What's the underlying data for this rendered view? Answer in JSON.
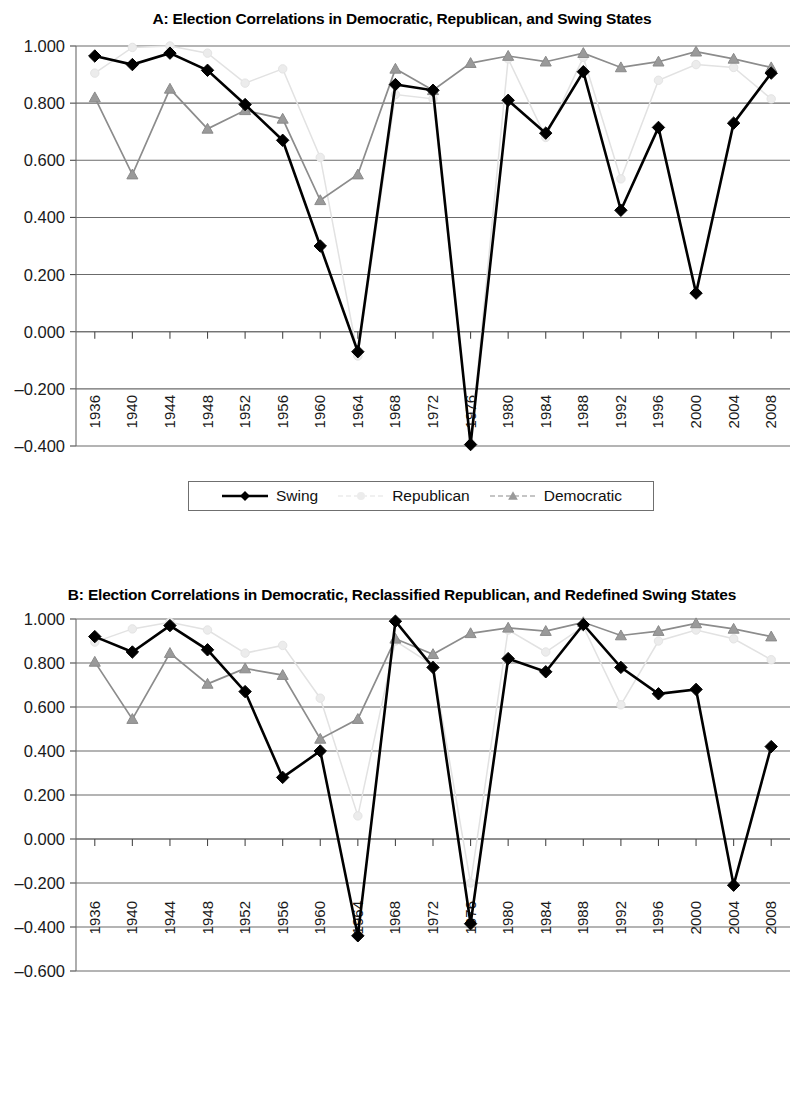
{
  "figures": [
    {
      "id": "A",
      "title": "A: Election Correlations in Democratic, Republican, and Swing States",
      "ylim": [
        -0.4,
        1.0
      ],
      "yticks": [
        "1.000",
        "0.800",
        "0.600",
        "0.400",
        "0.200",
        "0.000",
        "-0.200",
        "-0.400"
      ],
      "legend": [
        {
          "label": "Swing",
          "marker": "diamond",
          "color": "#000000"
        },
        {
          "label": "Republican",
          "marker": "circle",
          "color": "#ececec"
        },
        {
          "label": "Democratic",
          "marker": "triangle",
          "color": "#9a9a9a"
        }
      ]
    },
    {
      "id": "B",
      "title": "B: Election Correlations in Democratic, Reclassified Republican, and Redefined Swing States",
      "ylim": [
        -0.6,
        1.0
      ],
      "yticks": [
        "1.000",
        "0.800",
        "0.600",
        "0.400",
        "0.200",
        "0.000",
        "-0.200",
        "-0.400",
        "-0.600"
      ],
      "legend": [
        {
          "label": "Swing",
          "marker": "diamond",
          "color": "#000000"
        },
        {
          "label": "Republican",
          "marker": "circle",
          "color": "#ececec"
        },
        {
          "label": "Democratic",
          "marker": "triangle",
          "color": "#9a9a9a"
        }
      ]
    }
  ],
  "chart_data": [
    {
      "type": "line",
      "title": "A: Election Correlations in Democratic, Republican, and Swing States",
      "xlabel": "",
      "ylabel": "",
      "categories": [
        "1936",
        "1940",
        "1944",
        "1948",
        "1952",
        "1956",
        "1960",
        "1964",
        "1968",
        "1972",
        "1976",
        "1980",
        "1984",
        "1988",
        "1992",
        "1996",
        "2000",
        "2004",
        "2008"
      ],
      "ylim": [
        -0.4,
        1.0
      ],
      "yticks": [
        1.0,
        0.8,
        0.6,
        0.4,
        0.2,
        0.0,
        -0.2,
        -0.4
      ],
      "grid": true,
      "legend_position": "bottom",
      "series": [
        {
          "name": "Swing",
          "color": "#000000",
          "marker": "diamond",
          "values": [
            0.965,
            0.935,
            0.975,
            0.915,
            0.795,
            0.67,
            0.3,
            -0.07,
            0.865,
            0.845,
            -0.395,
            0.81,
            0.695,
            0.91,
            0.425,
            0.715,
            0.135,
            0.73,
            0.905
          ]
        },
        {
          "name": "Republican",
          "color": "#ececec",
          "marker": "circle",
          "values": [
            0.905,
            0.995,
            1.0,
            0.975,
            0.87,
            0.92,
            0.61,
            -0.085,
            0.83,
            0.815,
            -0.39,
            0.955,
            0.68,
            0.96,
            0.535,
            0.88,
            0.935,
            0.925,
            0.815
          ]
        },
        {
          "name": "Democratic",
          "color": "#9a9a9a",
          "marker": "triangle",
          "values": [
            0.82,
            0.55,
            0.85,
            0.71,
            0.775,
            0.745,
            0.46,
            0.55,
            0.92,
            0.845,
            0.94,
            0.965,
            0.945,
            0.975,
            0.925,
            0.945,
            0.98,
            0.955,
            0.925
          ]
        }
      ]
    },
    {
      "type": "line",
      "title": "B: Election Correlations in Democratic, Reclassified Republican, and Redefined Swing States",
      "xlabel": "",
      "ylabel": "",
      "categories": [
        "1936",
        "1940",
        "1944",
        "1948",
        "1952",
        "1956",
        "1960",
        "1964",
        "1968",
        "1972",
        "1976",
        "1980",
        "1984",
        "1988",
        "1992",
        "1996",
        "2000",
        "2004",
        "2008"
      ],
      "ylim": [
        -0.6,
        1.0
      ],
      "yticks": [
        1.0,
        0.8,
        0.6,
        0.4,
        0.2,
        0.0,
        -0.2,
        -0.4,
        -0.6
      ],
      "grid": true,
      "legend_position": "bottom",
      "series": [
        {
          "name": "Swing",
          "color": "#000000",
          "marker": "diamond",
          "values": [
            0.92,
            0.85,
            0.97,
            0.86,
            0.67,
            0.28,
            0.4,
            -0.44,
            0.99,
            0.78,
            -0.385,
            0.82,
            0.76,
            0.975,
            0.78,
            0.66,
            0.68,
            -0.21,
            0.42
          ]
        },
        {
          "name": "Republican",
          "color": "#ececec",
          "marker": "circle",
          "values": [
            0.895,
            0.955,
            0.985,
            0.95,
            0.845,
            0.88,
            0.64,
            0.105,
            0.9,
            0.79,
            -0.2,
            0.95,
            0.85,
            0.965,
            0.61,
            0.9,
            0.95,
            0.91,
            0.815
          ]
        },
        {
          "name": "Democratic",
          "color": "#9a9a9a",
          "marker": "triangle",
          "values": [
            0.805,
            0.545,
            0.845,
            0.705,
            0.775,
            0.745,
            0.455,
            0.545,
            0.91,
            0.84,
            0.935,
            0.96,
            0.945,
            0.985,
            0.925,
            0.945,
            0.98,
            0.955,
            0.92
          ]
        }
      ]
    }
  ]
}
